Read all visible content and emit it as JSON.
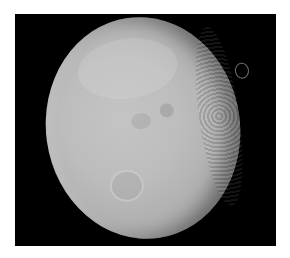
{
  "image": {
    "subject": "cratered moon photograph",
    "background_color": "#000000",
    "border_color": "#ffffff",
    "surface_color": "#bdbdbd"
  }
}
